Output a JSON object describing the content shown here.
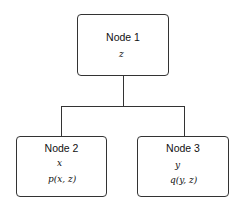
{
  "nodes": [
    {
      "id": "node1",
      "title": "Node 1",
      "lines": [
        "z"
      ]
    },
    {
      "id": "node2",
      "title": "Node 2",
      "lines": [
        "x",
        "p(x, z)"
      ]
    },
    {
      "id": "node3",
      "title": "Node 3",
      "lines": [
        "y",
        "q(y, z)"
      ]
    }
  ],
  "edges": [
    {
      "from": "Node 1",
      "to": "Node 2"
    },
    {
      "from": "Node 1",
      "to": "Node 3"
    }
  ]
}
